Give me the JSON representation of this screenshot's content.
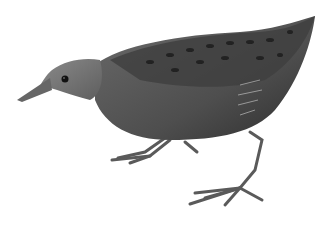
{
  "image": {
    "subject": "bird illustration",
    "description": "Grayscale painting of a small crake/rail walking left, body dark with spotted back, long legs and toes",
    "colors": {
      "background": "#ffffff",
      "body": "#555555",
      "back": "#3a3a3a",
      "head": "#777777",
      "spots": "#222222",
      "legs": "#5a5a5a",
      "beak": "#666666",
      "eye": "#111111"
    }
  }
}
